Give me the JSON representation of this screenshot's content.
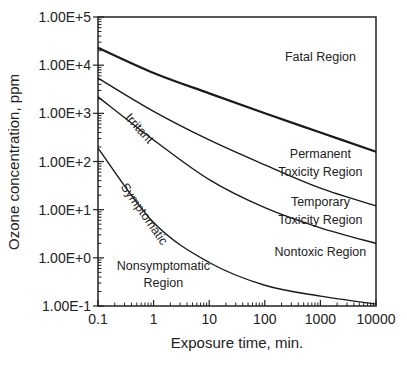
{
  "chart_data": {
    "type": "line",
    "title": "",
    "xlabel": "Exposure time, min.",
    "ylabel": "Ozone concentration, ppm",
    "xscale": "log",
    "yscale": "log",
    "xlim": [
      0.1,
      10000
    ],
    "ylim": [
      0.1,
      100000
    ],
    "grid": false,
    "legend": "none (inline region labels)",
    "x_ticks": [
      "0.1",
      "1",
      "10",
      "100",
      "1000",
      "10000"
    ],
    "y_ticks": [
      "1.00E-1",
      "1.00E+0",
      "1.00E+1",
      "1.00E+2",
      "1.00E+3",
      "1.00E+4",
      "1.00E+5"
    ],
    "x": [
      0.1,
      1,
      10,
      100,
      1000,
      10000
    ],
    "series": [
      {
        "name": "Fatal boundary",
        "values": [
          23000,
          6900,
          2600,
          1000,
          400,
          160
        ],
        "bold": true
      },
      {
        "name": "Irritant",
        "values": [
          5400,
          1100,
          280,
          85,
          28,
          12
        ]
      },
      {
        "name": "Temporary toxicity boundary",
        "values": [
          2200,
          280,
          42,
          11,
          4.2,
          2.0
        ]
      },
      {
        "name": "Symptomatic",
        "values": [
          190,
          5.4,
          0.8,
          0.27,
          0.16,
          0.11
        ]
      }
    ],
    "annotations": [
      {
        "text": "Fatal Region",
        "x": 1000,
        "y": 12000
      },
      {
        "text": "Permanent",
        "x": 1000,
        "y": 120
      },
      {
        "text": "Toxicity Region",
        "x": 1000,
        "y": 50
      },
      {
        "text": "Temporary",
        "x": 1000,
        "y": 12
      },
      {
        "text": "Toxicity Region",
        "x": 1000,
        "y": 5
      },
      {
        "text": "Nontoxic Region",
        "x": 1000,
        "y": 1.1
      },
      {
        "text": "Nonsymptomatic",
        "x": 1.5,
        "y": 0.55
      },
      {
        "text": "Region",
        "x": 1.5,
        "y": 0.25
      },
      {
        "text": "Irritant",
        "x": 0.3,
        "y": 800,
        "rotated": true
      },
      {
        "text": "Symptomatic",
        "x": 0.25,
        "y": 30,
        "rotated": true
      }
    ]
  }
}
